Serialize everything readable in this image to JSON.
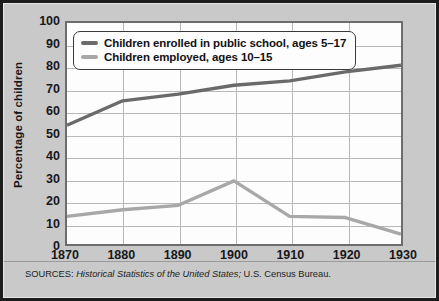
{
  "axis": {
    "ylabel": "Percentage of children",
    "yticks": [
      0,
      10,
      20,
      30,
      40,
      50,
      60,
      70,
      80,
      90,
      100
    ],
    "xticks": [
      1870,
      1880,
      1890,
      1900,
      1910,
      1920,
      1930
    ]
  },
  "legend": {
    "position": "top-left",
    "entries": [
      {
        "label": "Children enrolled in public school, ages 5–17",
        "color": "#6a6a6a"
      },
      {
        "label": "Children employed, ages 10–15",
        "color": "#a8a8a8"
      }
    ]
  },
  "source": {
    "prefix": "SOURCES: ",
    "italic": "Historical Statistics of the United States;",
    "suffix": " U.S. Census Bureau."
  },
  "colors": {
    "frame": "#1c1c1c",
    "background": "#c9c9c9",
    "plot_background": "#fdfdfd",
    "gridline": "#b9b9b9",
    "axis": "#6d6d6d",
    "series_enrolled": "#6a6a6a",
    "series_employed": "#a8a8a8",
    "text": "#17171a"
  },
  "chart_data": {
    "type": "line",
    "title": "",
    "xlabel": "",
    "ylabel": "Percentage of children",
    "x": [
      1870,
      1880,
      1890,
      1900,
      1910,
      1920,
      1930
    ],
    "xlim": [
      1870,
      1930
    ],
    "ylim": [
      0,
      100
    ],
    "grid": true,
    "legend_position": "top-left",
    "series": [
      {
        "name": "Children enrolled in public school, ages 5–17",
        "color": "#6a6a6a",
        "values": [
          54,
          65,
          68,
          72,
          74,
          78,
          81
        ]
      },
      {
        "name": "Children employed, ages 10–15",
        "color": "#a8a8a8",
        "values": [
          13,
          16,
          18,
          29,
          13,
          12.5,
          5
        ]
      }
    ]
  }
}
